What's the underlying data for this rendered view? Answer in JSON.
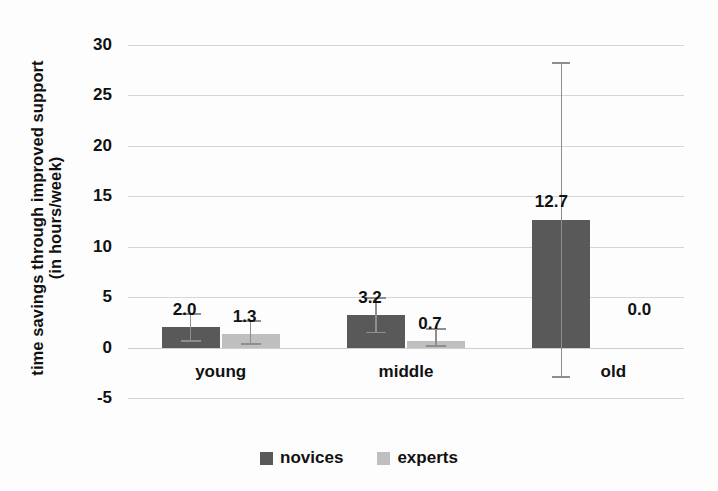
{
  "chart_data": {
    "type": "bar",
    "title": "",
    "xlabel": "",
    "ylabel_line1": "time savings through  improved support",
    "ylabel_line2": "(in hours/week)",
    "categories": [
      "young",
      "middle",
      "old"
    ],
    "series": [
      {
        "name": "novices",
        "color": "#595959",
        "values": [
          2.0,
          3.2,
          12.7
        ],
        "value_labels": [
          "2.0",
          "3.2",
          "12.7"
        ],
        "error_low": [
          0.6,
          1.4,
          -3.0
        ],
        "error_high": [
          3.4,
          5.0,
          28.3
        ]
      },
      {
        "name": "experts",
        "color": "#bfbfbf",
        "values": [
          1.3,
          0.7,
          0.0
        ],
        "value_labels": [
          "1.3",
          "0.7",
          "0.0"
        ],
        "error_low": [
          0.3,
          0.1,
          0.0
        ],
        "error_high": [
          2.7,
          1.9,
          0.0
        ]
      }
    ],
    "ylim": [
      -5,
      30
    ],
    "yticks": [
      30,
      25,
      20,
      15,
      10,
      5,
      0,
      -5
    ],
    "ytick_labels": [
      "30",
      "25",
      "20",
      "15",
      "10",
      "5",
      "0",
      "-5"
    ],
    "grid": true,
    "legend_position": "bottom",
    "legend_entries": [
      "novices",
      "experts"
    ],
    "colors": {
      "novices": "#595959",
      "experts": "#bfbfbf",
      "gridline": "#d6d6d6",
      "errorbar": "#8e8e8e",
      "text": "#111111",
      "background": "#fdfdfd"
    }
  }
}
